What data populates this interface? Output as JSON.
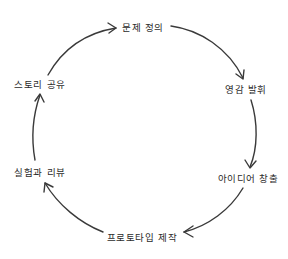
{
  "diagram": {
    "type": "cycle",
    "stroke_color": "#3a3a3a",
    "text_color": "#2b2b2b",
    "background": "#ffffff",
    "nodes": [
      {
        "id": "define",
        "label": "문제 정의"
      },
      {
        "id": "inspire",
        "label": "영감 발휘"
      },
      {
        "id": "ideate",
        "label": "아이디어 창출"
      },
      {
        "id": "prototype",
        "label": "프로토타입 제작"
      },
      {
        "id": "test",
        "label": "실험과 리뷰"
      },
      {
        "id": "share",
        "label": "스토리 공유"
      }
    ],
    "edges": [
      {
        "from": "define",
        "to": "inspire"
      },
      {
        "from": "inspire",
        "to": "ideate"
      },
      {
        "from": "ideate",
        "to": "prototype"
      },
      {
        "from": "prototype",
        "to": "test"
      },
      {
        "from": "test",
        "to": "share"
      },
      {
        "from": "share",
        "to": "define"
      }
    ]
  }
}
